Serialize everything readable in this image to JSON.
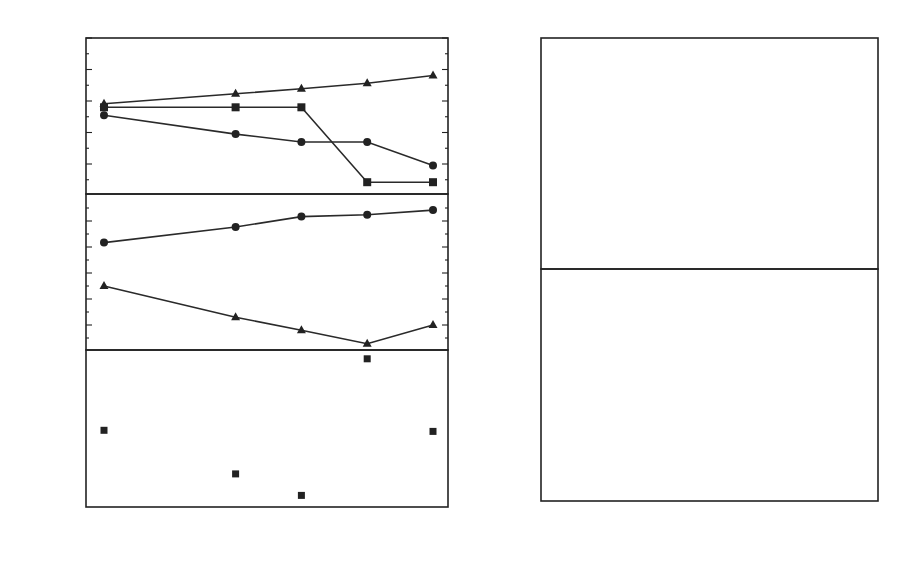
{
  "chart_data": [
    {
      "id": "top-left",
      "type": "line",
      "xlabel": "A2",
      "ylabel": "B_{η,R} (MeV)",
      "ylim": [
        6.05,
        11
      ],
      "yticks": [
        7,
        8,
        9,
        10,
        11
      ],
      "x": [
        124,
        128,
        130,
        132,
        134
      ],
      "series": [
        {
          "name": "B_R^qf",
          "marker": "triangle",
          "values": [
            8.9,
            9.22,
            9.38,
            9.55,
            9.8
          ]
        },
        {
          "name": "B_η1",
          "marker": "square",
          "values": [
            8.8,
            8.8,
            8.8,
            6.42,
            6.42
          ]
        },
        {
          "name": "B_η2",
          "marker": "circle",
          "values": [
            8.55,
            7.95,
            7.7,
            7.7,
            6.95
          ]
        }
      ]
    },
    {
      "id": "middle-left",
      "type": "line",
      "ylabel": "B_{ηZ} (MeV)",
      "ylim": [
        2.04,
        8.04
      ],
      "yticks": [
        3,
        4,
        5,
        6,
        7
      ],
      "x": [
        124,
        128,
        130,
        132,
        134
      ],
      "series": [
        {
          "name": "B_ηZ^sym",
          "marker": "circle",
          "values": [
            6.15,
            6.75,
            7.15,
            7.22,
            7.4
          ]
        },
        {
          "name": "B_ηZ^asym",
          "marker": "triangle",
          "values": [
            4.5,
            3.3,
            2.8,
            2.28,
            3.0
          ]
        }
      ]
    },
    {
      "id": "bottom-left",
      "type": "scatter",
      "xlabel": "A2",
      "ylabel": "σ_HD (nb)",
      "yscale": "log",
      "ylim": [
        10,
        204
      ],
      "yticks": [
        "10^1",
        "10^2"
      ],
      "xticks": [
        124,
        125,
        126,
        127,
        128,
        129,
        130,
        131,
        132,
        133,
        134
      ],
      "xlim": [
        123.5,
        134.5
      ],
      "annotation": "48Ca+ASn",
      "series": [
        {
          "name": "σ_HD",
          "marker": "square",
          "x": [
            124,
            128,
            130,
            132,
            134
          ],
          "values": [
            44,
            19,
            12.5,
            180,
            43
          ]
        }
      ]
    },
    {
      "id": "top-right",
      "type": "line",
      "ylabel": "T_i (s)",
      "yscale": "log",
      "ylim": [
        "4.5e-17",
        "1.8e-11"
      ],
      "yticks": [
        "10^-11",
        "10^-12",
        "10^-13",
        "10^-14",
        "10^-15",
        "10^-16"
      ],
      "xlim": [
        4.6,
        86.8
      ],
      "annotation": "60Ni+60Ni",
      "series": [
        {
          "name": "T_ηZ",
          "style": "dotted",
          "x": [
            5,
            20,
            40,
            60,
            85
          ],
          "values": [
            7.5e-12,
            8e-12,
            9e-12,
            1e-11,
            1.15e-11
          ]
        },
        {
          "name": "T_R",
          "style": "solid",
          "x": [
            5,
            10,
            15,
            20,
            25,
            30,
            35,
            40,
            45,
            50,
            55,
            60,
            65,
            70,
            75,
            80,
            85
          ],
          "values": [
            6e-12,
            4.6e-12,
            3.4e-12,
            2.2e-12,
            1.2e-12,
            5.5e-13,
            2.2e-13,
            7.5e-14,
            2.2e-14,
            6e-15,
            1.6e-15,
            4e-16,
            1e-16,
            2.4e-17,
            6e-18,
            1.5e-18,
            4e-19
          ]
        },
        {
          "name": "T_γ",
          "style": "dashed",
          "x": [
            10,
            12,
            15,
            20,
            25,
            30,
            35,
            40,
            45,
            50,
            55,
            60,
            65,
            70,
            75,
            80,
            85
          ],
          "values": [
            1.8e-11,
            6e-12,
            2e-12,
            4e-13,
            1.3e-13,
            5e-14,
            2.2e-14,
            1e-14,
            5e-15,
            2.8e-15,
            1.7e-15,
            1.1e-15,
            7.5e-16,
            5e-16,
            3.4e-16,
            2.4e-16,
            1.7e-16
          ]
        }
      ]
    },
    {
      "id": "bottom-right",
      "type": "line",
      "xlabel": "L",
      "ylabel": "T_i (s)",
      "yscale": "log",
      "ylim": [
        "1e-16",
        "5.8e-13"
      ],
      "yticks": [
        "10^-13",
        "10^-14",
        "10^-15",
        "10^-16"
      ],
      "xticks": [
        10,
        20,
        30,
        40,
        50,
        60,
        70,
        80
      ],
      "xlim": [
        4.6,
        86.8
      ],
      "annotation": "48Ca+140Ba",
      "series": [
        {
          "name": "T_ηZ",
          "style": "dotted",
          "x": [
            5,
            20,
            40,
            60,
            70,
            80,
            85
          ],
          "values": [
            1.5e-13,
            1.35e-13,
            1.1e-13,
            7.5e-14,
            5.5e-14,
            3.6e-14,
            2.8e-14
          ]
        },
        {
          "name": "T_R",
          "style": "solid",
          "x": [
            5,
            10,
            15,
            20,
            25,
            30,
            35,
            40,
            45,
            50,
            55,
            60,
            65,
            70,
            75,
            80,
            85
          ],
          "values": [
            5.5e-13,
            4.8e-13,
            4e-13,
            3.2e-13,
            2.5e-13,
            1.75e-13,
            1.2e-13,
            7.5e-14,
            4.4e-14,
            2.4e-14,
            1.2e-14,
            6.5e-15,
            3.4e-15,
            1.7e-15,
            8.5e-16,
            4.2e-16,
            2e-16
          ]
        },
        {
          "name": "T_γ",
          "style": "dashed",
          "x": [
            23,
            25,
            28,
            30,
            33,
            35,
            40,
            45,
            50,
            55,
            60,
            65,
            70,
            75,
            80,
            85
          ],
          "values": [
            6e-13,
            4e-13,
            2.6e-13,
            2e-13,
            1.4e-13,
            1.1e-13,
            6e-14,
            3.4e-14,
            2e-14,
            1.2e-14,
            7e-15,
            4.2e-15,
            2.8e-15,
            2e-15,
            1.5e-15,
            1.1e-15
          ]
        }
      ]
    }
  ],
  "labels": {
    "left": {
      "top_ylabel_main": "B",
      "top_ylabel_sub": "η,R",
      "top_ylabel_unit": "(MeV)",
      "mid_ylabel_main": "B",
      "mid_ylabel_sub": "ηZ",
      "mid_ylabel_unit": "(MeV)",
      "bot_ylabel_main": "σ",
      "bot_ylabel_sub": "HD",
      "bot_ylabel_unit": "(nb)",
      "xlabel_main": "A",
      "xlabel_sub": "2",
      "top_yticks": [
        "11",
        "10",
        "9",
        "8",
        "7"
      ],
      "mid_yticks": [
        "7",
        "6",
        "5",
        "4",
        "3"
      ],
      "bot_ytick_10": "10",
      "bot_ytick_10_exp1": "1",
      "bot_ytick_100": "10",
      "bot_ytick_100_exp": "2",
      "xticks": [
        "124",
        "125",
        "126",
        "127",
        "128",
        "129",
        "130",
        "131",
        "132",
        "133",
        "134"
      ],
      "ann_bqf_main": "B",
      "ann_bqf_sup": "qf",
      "ann_bqf_sub": "R",
      "ann_bn2_main": "B",
      "ann_bn2_sub": "η2",
      "ann_bn1_main": "B",
      "ann_bn1_sub": "η1",
      "ann_sym_main": "B",
      "ann_sym_sup": "sym",
      "ann_sym_sub": "ηZ",
      "ann_asym_main": "B",
      "ann_asym_sup": "asym",
      "ann_asym_sub": "ηZ",
      "ann_reaction_pre": "48",
      "ann_reaction_a": "Ca+",
      "ann_reaction_mid": "A",
      "ann_reaction_b": "Sn"
    },
    "right": {
      "ylabel_main": "T",
      "ylabel_sub": "i",
      "ylabel_unit": "(s)",
      "xlabel": "L",
      "base": "10",
      "top_exps": [
        "-11",
        "-12",
        "-13",
        "-14",
        "-15",
        "-16"
      ],
      "bot_exps": [
        "-13",
        "-14",
        "-15",
        "-16"
      ],
      "xticks": [
        "10",
        "20",
        "30",
        "40",
        "50",
        "60",
        "70",
        "80"
      ],
      "T_main": "T",
      "sub_eta": "ηZ",
      "sub_gamma": "γ",
      "sub_R": "R",
      "top_reaction_pre1": "60",
      "top_reaction_a": "Ni+",
      "top_reaction_pre2": "60",
      "top_reaction_b": "Ni",
      "bot_reaction_pre1": "48",
      "bot_reaction_a": "Ca+",
      "bot_reaction_pre2": "140",
      "bot_reaction_b": "Ba"
    }
  }
}
